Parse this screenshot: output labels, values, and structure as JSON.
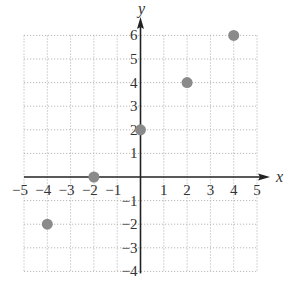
{
  "chart_data": {
    "type": "scatter",
    "title": "",
    "xlabel": "x",
    "ylabel": "y",
    "xlim": [
      -5,
      5
    ],
    "ylim": [
      -4,
      6
    ],
    "grid": true,
    "legend": null,
    "x_ticks": [
      "−5",
      "−4",
      "−3",
      "−2",
      "−1",
      "1",
      "2",
      "3",
      "4",
      "5"
    ],
    "y_ticks": [
      "−4",
      "−3",
      "−2",
      "−1",
      "1",
      "2",
      "3",
      "4",
      "5",
      "6"
    ],
    "series": [
      {
        "name": "points",
        "color": "#8a8a8a",
        "points": [
          {
            "x": -4,
            "y": -2
          },
          {
            "x": -2,
            "y": 0
          },
          {
            "x": 0,
            "y": 2
          },
          {
            "x": 2,
            "y": 4
          },
          {
            "x": 4,
            "y": 6
          }
        ]
      }
    ]
  },
  "colors": {
    "axis": "#222222",
    "grid": "#b8b8b8",
    "point": "#8a8a8a",
    "text": "#333333"
  }
}
